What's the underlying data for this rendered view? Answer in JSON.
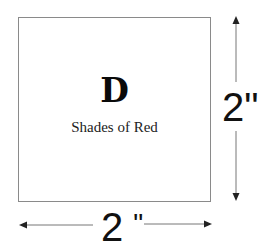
{
  "figure": {
    "letter": "D",
    "caption": "Shades of Red",
    "height_label": "2\"",
    "width_number": "2",
    "width_unit": "\"",
    "colors": {
      "box_border": "#8a8a8a",
      "text": "#111111",
      "arrow": "#555555"
    }
  }
}
